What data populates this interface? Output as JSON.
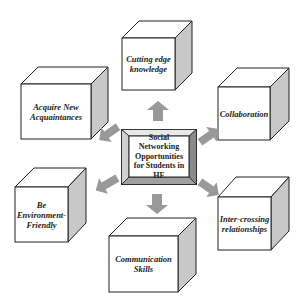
{
  "diagram": {
    "center": {
      "label": "Social Networking Opportunities for Students in HE"
    },
    "nodes": [
      {
        "id": "top",
        "label": "Cutting edge knowledge"
      },
      {
        "id": "top-left",
        "label": "Acquire New Acquaintances"
      },
      {
        "id": "top-right",
        "label": "Collaboration"
      },
      {
        "id": "bottom-left",
        "label": "Be Environment-Friendly"
      },
      {
        "id": "bottom-right",
        "label": "Inter-crossing relationships"
      },
      {
        "id": "bottom",
        "label": "Communication Skills"
      }
    ],
    "colors": {
      "cube_face": "#ffffff",
      "cube_side": "#c8c8c8",
      "cube_edge": "#222222",
      "arrow": "#999999",
      "center_bevel_light": "#e0e0e0",
      "center_bevel_dark": "#8a8a8a"
    }
  }
}
